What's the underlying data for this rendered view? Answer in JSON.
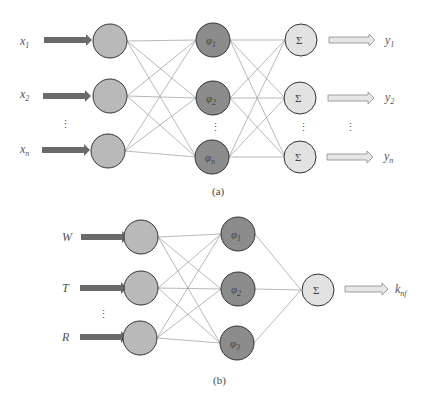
{
  "colors": {
    "input_node": "#b9b9b9",
    "hidden_node": "#8c8c8c",
    "output_node": "#e2e2e2",
    "node_stroke": "#333333",
    "edge": "#9a9a9a",
    "input_arrow": "#6a6a6a",
    "output_arrow_fill": "#e6e6e6",
    "output_arrow_stroke": "#8a8a8a"
  },
  "panel_a": {
    "caption": "(a)",
    "inputs": [
      {
        "label": "x",
        "sub": "1"
      },
      {
        "label": "x",
        "sub": "2"
      },
      {
        "label": "x",
        "sub": "n"
      }
    ],
    "hidden": [
      {
        "label": "φ",
        "sub": "1"
      },
      {
        "label": "φ",
        "sub": "2"
      },
      {
        "label": "φ",
        "sub": "n"
      }
    ],
    "outputs_node_label": "Σ",
    "outputs": [
      {
        "label": "y",
        "sub": "1"
      },
      {
        "label": "y",
        "sub": "2"
      },
      {
        "label": "y",
        "sub": "n"
      }
    ],
    "ellipsis": "⋮"
  },
  "panel_b": {
    "caption": "(b)",
    "inputs": [
      {
        "label": "W"
      },
      {
        "label": "T"
      },
      {
        "label": "R"
      }
    ],
    "hidden": [
      {
        "label": "φ",
        "sub": "1"
      },
      {
        "label": "φ",
        "sub": "2"
      },
      {
        "label": "φ",
        "sub": "3"
      }
    ],
    "output_node_label": "Σ",
    "output": {
      "label": "k",
      "sub": "nf"
    },
    "ellipsis": "⋮"
  }
}
